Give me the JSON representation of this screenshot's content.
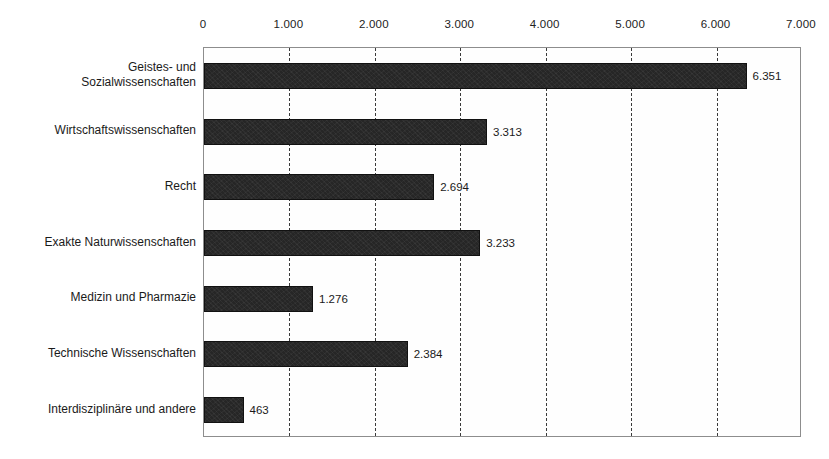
{
  "chart_data": {
    "type": "bar",
    "orientation": "horizontal",
    "title": "",
    "xlabel": "",
    "ylabel": "",
    "xlim": [
      0,
      7000
    ],
    "grid": true,
    "legend": false,
    "number_format": "de-DE",
    "xticks": [
      {
        "value": 0,
        "label": "0"
      },
      {
        "value": 1000,
        "label": "1.000"
      },
      {
        "value": 2000,
        "label": "2.000"
      },
      {
        "value": 3000,
        "label": "3.000"
      },
      {
        "value": 4000,
        "label": "4.000"
      },
      {
        "value": 5000,
        "label": "5.000"
      },
      {
        "value": 6000,
        "label": "6.000"
      },
      {
        "value": 7000,
        "label": "7.000"
      }
    ],
    "categories": [
      "Geistes- und\nSozialwissenschaften",
      "Wirtschaftswissenschaften",
      "Recht",
      "Exakte Naturwissenschaften",
      "Medizin und Pharmazie",
      "Technische Wissenschaften",
      "Interdisziplinäre und andere"
    ],
    "values": [
      6351,
      3313,
      2694,
      3233,
      1276,
      2384,
      463
    ],
    "value_labels": [
      "6.351",
      "3.313",
      "2.694",
      "3.233",
      "1.276",
      "2.384",
      "463"
    ],
    "bar_color": "#262626"
  }
}
